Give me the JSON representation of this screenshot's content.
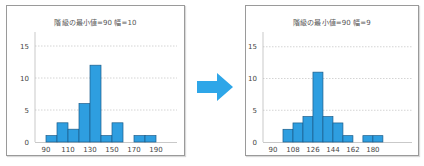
{
  "colors": {
    "bar_fill": "#2e9ee0",
    "bar_stroke": "#1a5c8a",
    "arrow": "#2ea6e8",
    "grid": "#c9c9c9",
    "axis": "#bbbbbb",
    "text": "#444444"
  },
  "arrow": {
    "icon": "right-arrow-icon"
  },
  "chart_data": [
    {
      "type": "bar",
      "title": "階級の最小値=90 幅=10",
      "xlabel": "",
      "ylabel": "",
      "bin_start": 90,
      "bin_width": 10,
      "bins": [
        [
          90,
          100
        ],
        [
          100,
          110
        ],
        [
          110,
          120
        ],
        [
          120,
          130
        ],
        [
          130,
          140
        ],
        [
          140,
          150
        ],
        [
          150,
          160
        ],
        [
          160,
          170
        ],
        [
          170,
          180
        ],
        [
          180,
          190
        ]
      ],
      "values": [
        1,
        3,
        2,
        6,
        12,
        1,
        3,
        0,
        1,
        1
      ],
      "x_ticks": [
        90,
        110,
        130,
        150,
        170,
        190
      ],
      "y_ticks": [
        0,
        5,
        10,
        15
      ],
      "xlim": [
        82,
        206
      ],
      "ylim": [
        0,
        17
      ],
      "grid": "horizontal dotted",
      "legend": "none"
    },
    {
      "type": "bar",
      "title": "階級の最小値=90 幅=9",
      "xlabel": "",
      "ylabel": "",
      "bin_start": 90,
      "bin_width": 9,
      "bins": [
        [
          99,
          108
        ],
        [
          108,
          117
        ],
        [
          117,
          126
        ],
        [
          126,
          135
        ],
        [
          135,
          144
        ],
        [
          144,
          153
        ],
        [
          153,
          162
        ],
        [
          162,
          171
        ],
        [
          171,
          180
        ],
        [
          180,
          189
        ]
      ],
      "values": [
        2,
        3,
        4,
        11,
        4,
        3,
        1,
        0,
        1,
        1
      ],
      "x_ticks": [
        90,
        108,
        126,
        144,
        162,
        180
      ],
      "y_ticks": [
        0,
        5,
        10,
        15
      ],
      "xlim": [
        81,
        205
      ],
      "ylim": [
        0,
        17
      ],
      "grid": "horizontal dotted",
      "legend": "none"
    }
  ]
}
